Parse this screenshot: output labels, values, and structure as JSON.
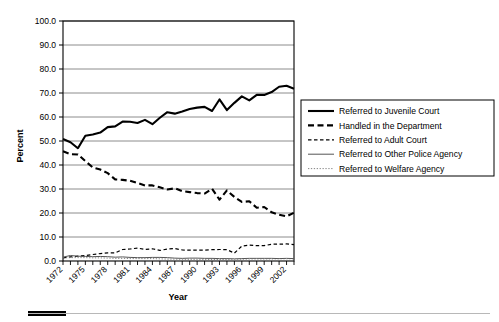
{
  "chart_data": {
    "type": "line",
    "title": "",
    "xlabel": "Year",
    "ylabel": "Percent",
    "ylim": [
      0,
      100
    ],
    "ytick_step": 10,
    "ytick_labels": [
      "0.0",
      "10.0",
      "20.0",
      "30.0",
      "40.0",
      "50.0",
      "60.0",
      "70.0",
      "80.0",
      "90.0",
      "100.0"
    ],
    "xlim": [
      1972,
      2003
    ],
    "xtick_labels": [
      "1972",
      "1975",
      "1978",
      "1981",
      "1984",
      "1987",
      "1990",
      "1993",
      "1996",
      "1999",
      "2002"
    ],
    "xtick_all_years": true,
    "grid": "horizontal",
    "legend_position": "right",
    "x": [
      1972,
      1973,
      1974,
      1975,
      1976,
      1977,
      1978,
      1979,
      1980,
      1981,
      1982,
      1983,
      1984,
      1985,
      1986,
      1987,
      1988,
      1989,
      1990,
      1991,
      1992,
      1993,
      1994,
      1995,
      1996,
      1997,
      1998,
      1999,
      2000,
      2001,
      2002,
      2003
    ],
    "series": [
      {
        "name": "Referred to Juvenile Court",
        "style": "solid-thick",
        "color": "#000000",
        "values": [
          50.8,
          49.5,
          47.0,
          52.2,
          52.7,
          53.5,
          55.8,
          56.1,
          58.1,
          58.0,
          57.5,
          58.8,
          57.0,
          59.7,
          62.0,
          61.4,
          62.3,
          63.3,
          63.9,
          64.2,
          62.5,
          67.3,
          62.9,
          65.9,
          68.6,
          66.9,
          69.2,
          69.2,
          70.4,
          72.6,
          73.0,
          71.8
        ]
      },
      {
        "name": "Handled in the Department",
        "style": "dashed-thick",
        "color": "#000000",
        "values": [
          45.7,
          44.5,
          44.4,
          41.6,
          39.0,
          38.1,
          36.6,
          34.0,
          33.8,
          33.4,
          32.5,
          31.5,
          31.5,
          30.7,
          29.8,
          30.3,
          29.1,
          28.7,
          28.3,
          28.1,
          30.1,
          25.6,
          29.4,
          26.7,
          24.6,
          24.9,
          22.2,
          22.5,
          20.3,
          19.3,
          18.6,
          20.1
        ]
      },
      {
        "name": "Referred to Adult Court",
        "style": "dashed-thin",
        "color": "#000000",
        "values": [
          1.3,
          1.7,
          2.0,
          2.3,
          2.7,
          3.1,
          3.4,
          3.4,
          4.8,
          5.0,
          5.4,
          4.8,
          5.1,
          4.4,
          5.0,
          5.2,
          4.6,
          4.5,
          4.5,
          4.5,
          4.7,
          4.8,
          4.7,
          3.3,
          6.2,
          6.6,
          6.4,
          6.4,
          7.0,
          7.0,
          7.1,
          6.8
        ]
      },
      {
        "name": "Referred to Other Police Agency",
        "style": "solid-thin",
        "color": "#555555",
        "values": [
          1.6,
          2.3,
          2.0,
          1.9,
          1.8,
          1.9,
          1.8,
          1.6,
          1.7,
          1.5,
          1.4,
          1.4,
          1.5,
          1.5,
          1.4,
          1.2,
          1.1,
          1.2,
          1.2,
          1.1,
          1.1,
          1.0,
          1.0,
          0.9,
          1.0,
          1.1,
          1.1,
          1.1,
          1.1,
          1.0,
          1.1,
          1.0
        ]
      },
      {
        "name": "Referred to Welfare Agency",
        "style": "dotted-thin",
        "color": "#777777",
        "values": [
          1.3,
          1.4,
          1.4,
          1.4,
          1.3,
          1.3,
          1.2,
          1.1,
          1.1,
          1.0,
          1.0,
          1.0,
          1.0,
          0.9,
          0.8,
          0.8,
          0.7,
          0.7,
          0.7,
          0.7,
          0.6,
          0.6,
          0.6,
          0.5,
          0.5,
          0.4,
          0.4,
          0.4,
          0.4,
          0.3,
          0.3,
          0.3
        ]
      }
    ]
  }
}
